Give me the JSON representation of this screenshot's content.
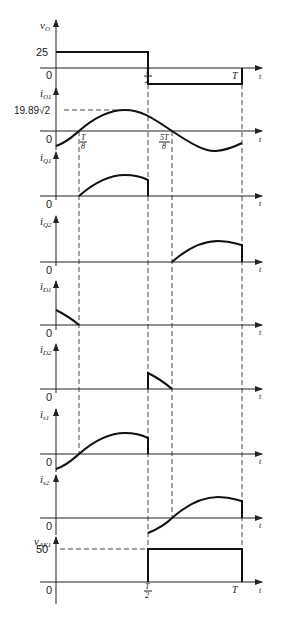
{
  "figure": {
    "time_marks": {
      "t_eighth": "T/8",
      "t_half": "T/2",
      "t_5eighth": "5T/8",
      "t_full": "T",
      "axis_var": "t"
    },
    "panels": [
      {
        "id": "vO",
        "label": "v",
        "sub": "O",
        "levels": [
          "25",
          "0"
        ]
      },
      {
        "id": "iO1",
        "label": "i",
        "sub": "O1",
        "levels": [
          "19.89√2",
          "0"
        ]
      },
      {
        "id": "iQ1",
        "label": "i",
        "sub": "Q1",
        "levels": [
          "0"
        ]
      },
      {
        "id": "iQ2",
        "label": "i",
        "sub": "Q2",
        "levels": [
          "0"
        ]
      },
      {
        "id": "iD1",
        "label": "i",
        "sub": "D1",
        "levels": [
          "0"
        ]
      },
      {
        "id": "iD2",
        "label": "i",
        "sub": "D2",
        "levels": [
          "0"
        ]
      },
      {
        "id": "is1",
        "label": "i",
        "sub": "s1",
        "levels": [
          "0"
        ]
      },
      {
        "id": "is2",
        "label": "i",
        "sub": "s2",
        "levels": [
          "0"
        ]
      },
      {
        "id": "vAK1",
        "label": "v",
        "sub": "AK1",
        "levels": [
          "50",
          "0"
        ]
      }
    ]
  }
}
